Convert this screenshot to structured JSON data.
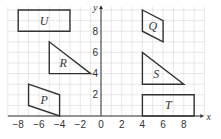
{
  "diagram": {
    "type": "coordinate-grid-shapes",
    "axes": {
      "x_label": "x",
      "y_label": "y",
      "x_ticks": [
        "−8",
        "−6",
        "−4",
        "−2",
        "0",
        "2",
        "4",
        "6",
        "8"
      ],
      "y_ticks": [
        "2",
        "4",
        "6",
        "8"
      ],
      "x_range": [
        -9,
        10
      ],
      "y_range": [
        0,
        10
      ]
    },
    "shapes": [
      {
        "label": "U",
        "kind": "rectangle",
        "vertices": [
          [
            -8,
            10
          ],
          [
            -3,
            10
          ],
          [
            -3,
            8
          ],
          [
            -8,
            8
          ]
        ]
      },
      {
        "label": "Q",
        "kind": "parallelogram",
        "vertices": [
          [
            4,
            10
          ],
          [
            6,
            9
          ],
          [
            6,
            7
          ],
          [
            4,
            8
          ]
        ]
      },
      {
        "label": "R",
        "kind": "triangle",
        "vertices": [
          [
            -5,
            7
          ],
          [
            -5,
            4
          ],
          [
            -1,
            4
          ]
        ]
      },
      {
        "label": "S",
        "kind": "triangle",
        "vertices": [
          [
            4,
            6
          ],
          [
            4,
            3
          ],
          [
            8,
            3
          ]
        ]
      },
      {
        "label": "P",
        "kind": "parallelogram",
        "vertices": [
          [
            -7,
            3
          ],
          [
            -4,
            2
          ],
          [
            -4,
            0
          ],
          [
            -7,
            1
          ]
        ]
      },
      {
        "label": "T",
        "kind": "rectangle",
        "vertices": [
          [
            4,
            2
          ],
          [
            9,
            2
          ],
          [
            9,
            0
          ],
          [
            4,
            0
          ]
        ]
      }
    ],
    "colors": {
      "grid": "#d9d9d9",
      "axis": "#333333",
      "shape_stroke": "#333333"
    }
  }
}
